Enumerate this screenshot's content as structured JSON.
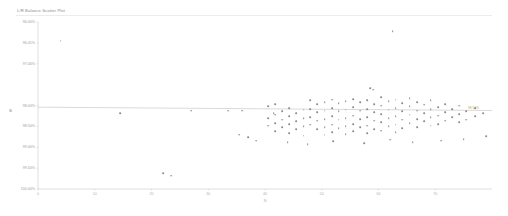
{
  "chart_data": {
    "type": "scatter",
    "title": "L/R Balance Scatter Plot",
    "xlabel": "N",
    "ylabel": "S",
    "xlim": [
      0,
      80
    ],
    "ylim": [
      100.0,
      96.0
    ],
    "grid": false,
    "legend": null,
    "y_inverted": true,
    "xticks": [
      0,
      10,
      20,
      30,
      40,
      50,
      60,
      70
    ],
    "xtick_labels": [
      "0",
      "10",
      "20",
      "30",
      "40",
      "50",
      "60",
      "70"
    ],
    "yticks": [
      96.0,
      96.5,
      97.0,
      98.0,
      98.5,
      99.0,
      99.5,
      100.0
    ],
    "ytick_labels": [
      "96.00%",
      "96.41%",
      "97.00%",
      "98.00%",
      "98.50%",
      "99.00%",
      "99.50%",
      "100.00%"
    ],
    "trendline": {
      "label": "98.50%",
      "y_left": 98.04,
      "y_right": 98.12,
      "color": "#b9b9b9"
    },
    "series": [
      {
        "name": "L/R Balance",
        "color": "#8a8a8a",
        "points": [
          [
            4.0,
            96.45
          ],
          [
            14.5,
            98.18
          ],
          [
            27.0,
            98.12
          ],
          [
            41.5,
            98.18
          ],
          [
            22.0,
            99.62
          ],
          [
            33.5,
            98.12
          ],
          [
            36.0,
            98.12
          ],
          [
            40.5,
            98.02
          ],
          [
            40.5,
            98.3
          ],
          [
            40.5,
            98.48
          ],
          [
            41.8,
            97.96
          ],
          [
            41.8,
            98.22
          ],
          [
            41.8,
            98.42
          ],
          [
            41.8,
            98.62
          ],
          [
            43.0,
            98.14
          ],
          [
            43.0,
            98.34
          ],
          [
            43.0,
            98.52
          ],
          [
            44.2,
            98.06
          ],
          [
            44.2,
            98.26
          ],
          [
            44.2,
            98.44
          ],
          [
            44.2,
            98.66
          ],
          [
            45.5,
            98.18
          ],
          [
            45.5,
            98.38
          ],
          [
            45.5,
            98.56
          ],
          [
            46.8,
            98.1
          ],
          [
            46.8,
            98.3
          ],
          [
            46.8,
            98.5
          ],
          [
            46.8,
            98.72
          ],
          [
            48.0,
            97.88
          ],
          [
            48.0,
            98.08
          ],
          [
            48.0,
            98.28
          ],
          [
            48.0,
            98.46
          ],
          [
            49.2,
            97.96
          ],
          [
            49.2,
            98.16
          ],
          [
            49.2,
            98.36
          ],
          [
            49.2,
            98.56
          ],
          [
            50.5,
            97.92
          ],
          [
            50.5,
            98.12
          ],
          [
            50.5,
            98.32
          ],
          [
            50.5,
            98.52
          ],
          [
            50.5,
            98.7
          ],
          [
            51.8,
            97.86
          ],
          [
            51.8,
            98.06
          ],
          [
            51.8,
            98.26
          ],
          [
            51.8,
            98.46
          ],
          [
            51.8,
            98.64
          ],
          [
            53.0,
            97.94
          ],
          [
            53.0,
            98.14
          ],
          [
            53.0,
            98.34
          ],
          [
            53.0,
            98.54
          ],
          [
            54.2,
            97.9
          ],
          [
            54.2,
            98.1
          ],
          [
            54.2,
            98.3
          ],
          [
            54.2,
            98.5
          ],
          [
            54.2,
            98.68
          ],
          [
            55.5,
            97.84
          ],
          [
            55.5,
            98.04
          ],
          [
            55.5,
            98.24
          ],
          [
            55.5,
            98.44
          ],
          [
            55.5,
            98.62
          ],
          [
            56.8,
            97.92
          ],
          [
            56.8,
            98.12
          ],
          [
            56.8,
            98.32
          ],
          [
            56.8,
            98.52
          ],
          [
            58.0,
            97.88
          ],
          [
            58.0,
            98.08
          ],
          [
            58.0,
            98.28
          ],
          [
            58.0,
            98.48
          ],
          [
            58.0,
            98.66
          ],
          [
            59.2,
            97.96
          ],
          [
            59.2,
            98.16
          ],
          [
            59.2,
            98.36
          ],
          [
            59.2,
            98.56
          ],
          [
            60.5,
            97.8
          ],
          [
            60.5,
            98.0
          ],
          [
            60.5,
            98.2
          ],
          [
            60.5,
            98.4
          ],
          [
            60.5,
            98.6
          ],
          [
            61.8,
            97.9
          ],
          [
            61.8,
            98.1
          ],
          [
            61.8,
            98.3
          ],
          [
            61.8,
            98.5
          ],
          [
            63.0,
            97.86
          ],
          [
            63.0,
            98.06
          ],
          [
            63.0,
            98.26
          ],
          [
            63.0,
            98.46
          ],
          [
            63.0,
            98.64
          ],
          [
            64.2,
            97.94
          ],
          [
            64.2,
            98.14
          ],
          [
            64.2,
            98.34
          ],
          [
            64.2,
            98.54
          ],
          [
            65.5,
            97.82
          ],
          [
            65.5,
            98.02
          ],
          [
            65.5,
            98.22
          ],
          [
            65.5,
            98.42
          ],
          [
            66.8,
            97.92
          ],
          [
            66.8,
            98.12
          ],
          [
            66.8,
            98.32
          ],
          [
            66.8,
            98.52
          ],
          [
            68.0,
            97.98
          ],
          [
            68.0,
            98.18
          ],
          [
            68.0,
            98.38
          ],
          [
            69.2,
            97.88
          ],
          [
            69.2,
            98.08
          ],
          [
            69.2,
            98.28
          ],
          [
            69.2,
            98.48
          ],
          [
            70.5,
            98.04
          ],
          [
            70.5,
            98.24
          ],
          [
            70.5,
            98.44
          ],
          [
            71.8,
            97.96
          ],
          [
            71.8,
            98.16
          ],
          [
            71.8,
            98.36
          ],
          [
            73.0,
            98.08
          ],
          [
            73.0,
            98.28
          ],
          [
            74.2,
            98.0
          ],
          [
            74.2,
            98.2
          ],
          [
            74.2,
            98.4
          ],
          [
            75.5,
            98.14
          ],
          [
            75.5,
            98.34
          ],
          [
            77.0,
            98.06
          ],
          [
            77.0,
            98.26
          ],
          [
            78.5,
            98.18
          ],
          [
            38.5,
            98.84
          ],
          [
            44.0,
            98.88
          ],
          [
            47.5,
            98.92
          ],
          [
            52.0,
            98.86
          ],
          [
            57.5,
            98.9
          ],
          [
            62.0,
            98.82
          ],
          [
            66.0,
            98.88
          ],
          [
            71.0,
            98.84
          ],
          [
            75.0,
            98.8
          ],
          [
            79.0,
            98.74
          ],
          [
            35.5,
            98.7
          ],
          [
            37.0,
            98.76
          ],
          [
            58.5,
            97.58
          ],
          [
            59.0,
            97.62
          ],
          [
            23.5,
            99.68
          ],
          [
            62.5,
            96.22
          ]
        ]
      }
    ]
  }
}
